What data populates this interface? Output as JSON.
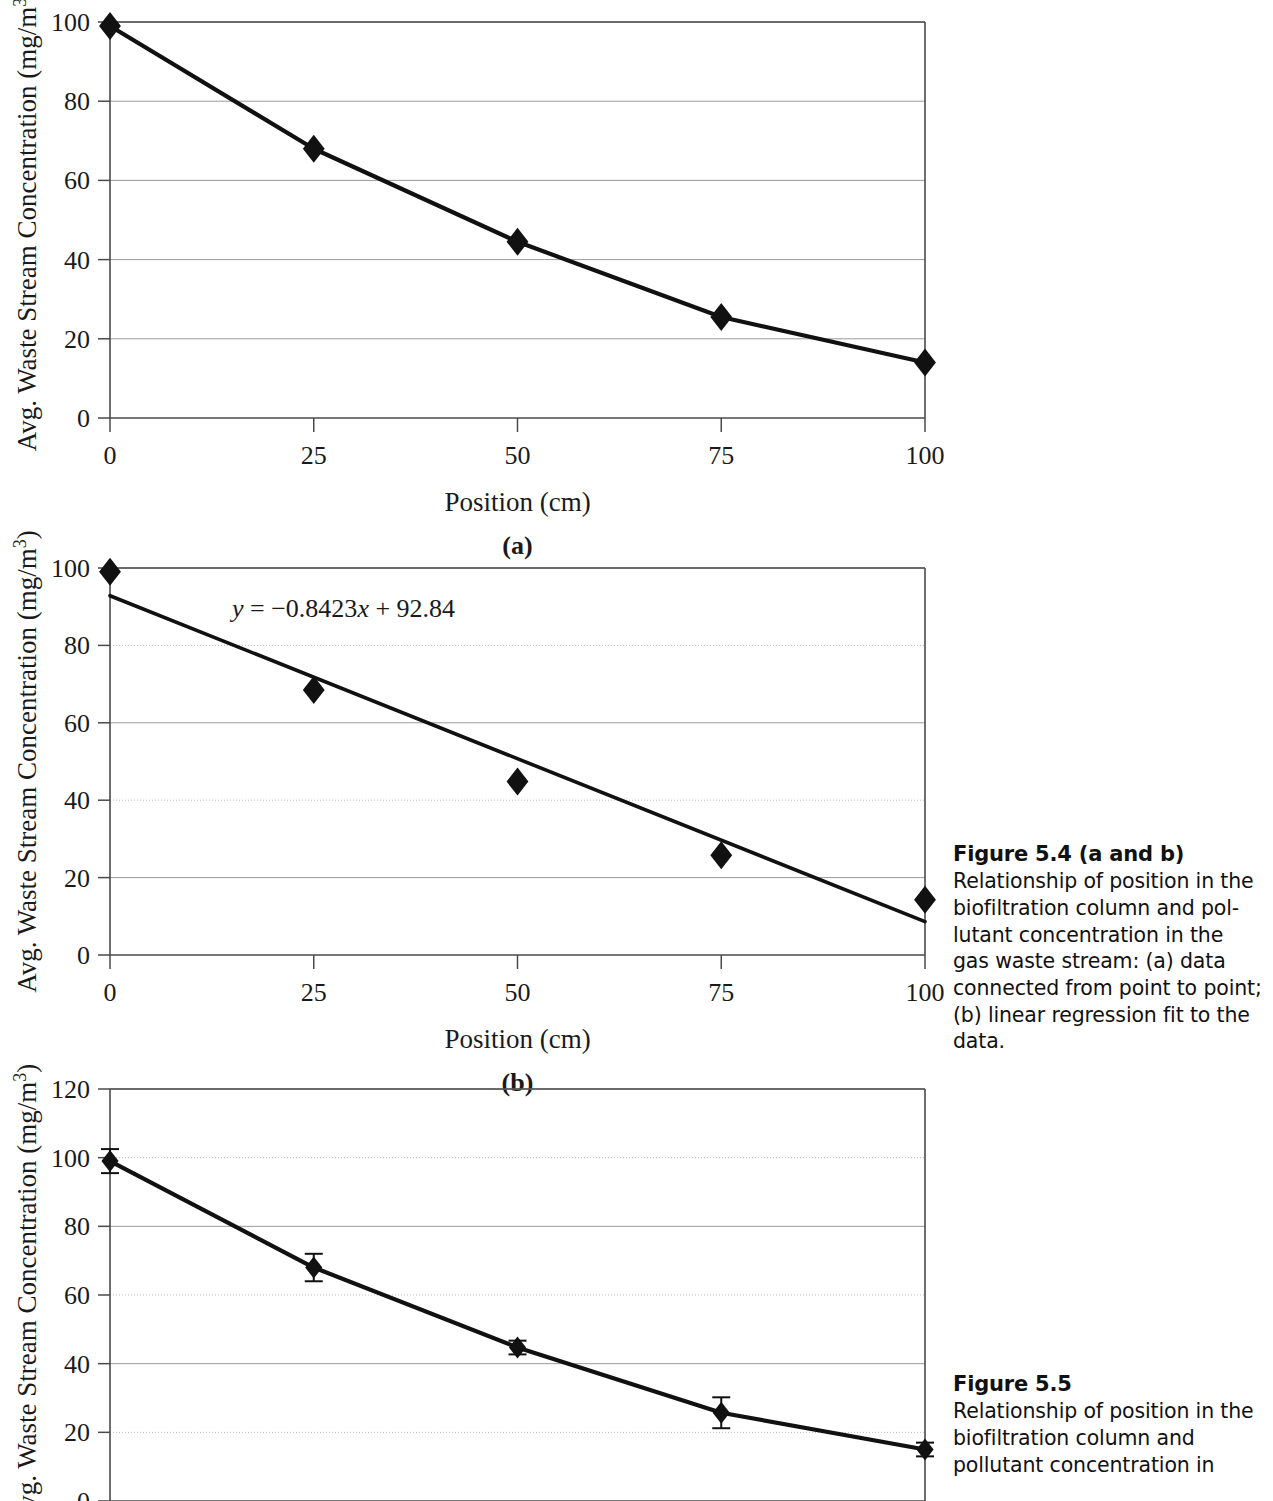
{
  "page": {
    "width": 1273,
    "height": 1501,
    "background": "#ffffff",
    "ink": "#111111"
  },
  "captions": {
    "fig54": {
      "title": "Figure 5.4 (a and b)",
      "body": "Relationship of position in the biofiltration column and pol-lutant concentration in the gas waste stream: (a) data connected from point to point; (b) linear regression fit to the data."
    },
    "fig55": {
      "title": "Figure 5.5",
      "body": "Relationship of position in the biofiltration column and pollutant concentration in"
    }
  },
  "chart_data": [
    {
      "id": "a",
      "type": "line",
      "panel_label": "(a)",
      "title": "",
      "xlabel": "Position (cm)",
      "ylabel": "Avg. Waste Stream Concentration (mg/m³)",
      "ylabel_base": "Avg. Waste Stream Concentration (mg/m",
      "ylabel_sup": "3",
      "ylabel_tail": ")",
      "x": [
        0,
        25,
        50,
        75,
        100
      ],
      "values": [
        99,
        68,
        44.5,
        25.5,
        14
      ],
      "xticks": [
        0,
        25,
        50,
        75,
        100
      ],
      "yticks": [
        0,
        20,
        40,
        60,
        80,
        100
      ],
      "xlim": [
        0,
        100
      ],
      "ylim": [
        0,
        100
      ],
      "grid": true,
      "grid_style": "solid",
      "marker": "diamond",
      "legend": "none",
      "series_name": "Avg. Waste Stream Concentration"
    },
    {
      "id": "b",
      "type": "scatter",
      "panel_label": "(b)",
      "title": "",
      "xlabel": "Position (cm)",
      "ylabel": "Avg. Waste Stream Concentration (mg/m³)",
      "ylabel_base": "Avg. Waste Stream Concentration (mg/m",
      "ylabel_sup": "3",
      "ylabel_tail": ")",
      "x": [
        0,
        25,
        50,
        75,
        100
      ],
      "values": [
        99,
        68.5,
        44.8,
        25.8,
        14.3
      ],
      "xticks": [
        0,
        25,
        50,
        75,
        100
      ],
      "yticks": [
        0,
        20,
        40,
        60,
        80,
        100
      ],
      "xlim": [
        0,
        100
      ],
      "ylim": [
        0,
        100
      ],
      "grid": true,
      "grid_style": "dotted",
      "marker": "diamond",
      "legend": "none",
      "fit": {
        "slope": -0.8423,
        "intercept": 92.84,
        "equation_parts": {
          "y": "y",
          "eq": "=",
          "slope_term": "−0.8423",
          "x": "x",
          "plus": "+",
          "intercept": "92.84"
        },
        "equation": "y = −0.8423x + 92.84"
      }
    },
    {
      "id": "c",
      "type": "line",
      "panel_label": "",
      "title": "",
      "xlabel": "",
      "ylabel": "Avg. Waste Stream Concentration (mg/m³)",
      "ylabel_base": "Avg. Waste Stream Concentration (mg/m",
      "ylabel_sup": "3",
      "ylabel_tail": ")",
      "x": [
        0,
        25,
        50,
        75,
        100
      ],
      "values": [
        99,
        68,
        44.7,
        25.7,
        15
      ],
      "errors": [
        3.5,
        4.0,
        2.0,
        4.5,
        2.0
      ],
      "xticks": [
        0,
        25,
        50,
        75,
        100
      ],
      "yticks": [
        0,
        20,
        40,
        60,
        80,
        100,
        120
      ],
      "xlim": [
        0,
        100
      ],
      "ylim": [
        0,
        120
      ],
      "grid": true,
      "grid_style": "mixed",
      "marker": "diamond",
      "error_bars": true,
      "legend": "none"
    }
  ]
}
